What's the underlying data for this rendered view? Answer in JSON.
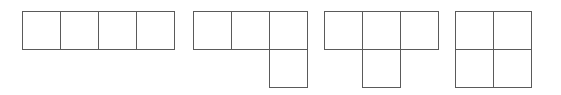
{
  "diagram": {
    "cell_size": 38,
    "line_color": "#5a5a5a",
    "background": "#ffffff",
    "shapes": [
      {
        "name": "I-tetromino",
        "origin": [
          22,
          11
        ],
        "cells": [
          [
            0,
            0
          ],
          [
            1,
            0
          ],
          [
            2,
            0
          ],
          [
            3,
            0
          ]
        ]
      },
      {
        "name": "L-tetromino",
        "origin": [
          193,
          11
        ],
        "cells": [
          [
            0,
            0
          ],
          [
            1,
            0
          ],
          [
            2,
            0
          ],
          [
            2,
            1
          ]
        ]
      },
      {
        "name": "T-tetromino",
        "origin": [
          324,
          11
        ],
        "cells": [
          [
            0,
            0
          ],
          [
            1,
            0
          ],
          [
            2,
            0
          ],
          [
            1,
            1
          ]
        ]
      },
      {
        "name": "O-tetromino",
        "origin": [
          455,
          11
        ],
        "cells": [
          [
            0,
            0
          ],
          [
            1,
            0
          ],
          [
            0,
            1
          ],
          [
            1,
            1
          ]
        ]
      }
    ]
  }
}
